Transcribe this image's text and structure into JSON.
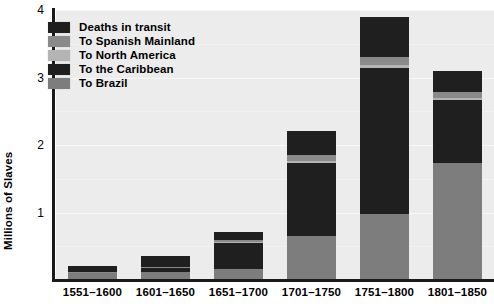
{
  "chart_data": {
    "type": "bar",
    "stacked": true,
    "title": "",
    "xlabel": "",
    "ylabel": "Millions of Slaves",
    "ylim": [
      0,
      4
    ],
    "yticks": [
      "1",
      "2",
      "3",
      "4"
    ],
    "ytick_values": [
      1,
      2,
      3,
      4
    ],
    "grid": true,
    "legend_position": "top-left",
    "categories": [
      "1551–1600",
      "1601–1650",
      "1651–1700",
      "1701–1750",
      "1751–1800",
      "1801–1850"
    ],
    "series": [
      {
        "name": "To Brazil",
        "color": "#7d7d7d",
        "values": [
          0.1,
          0.12,
          0.16,
          0.65,
          0.98,
          1.74
        ]
      },
      {
        "name": "To the Caribbean",
        "color": "#1f1f1f",
        "values": [
          0.0,
          0.06,
          0.39,
          1.09,
          2.16,
          0.92
        ]
      },
      {
        "name": "To North America",
        "color": "#b4b4b4",
        "values": [
          0.0,
          0.0,
          0.01,
          0.02,
          0.04,
          0.03
        ]
      },
      {
        "name": "To Spanish Mainland",
        "color": "#8a8a8a",
        "values": [
          0.02,
          0.02,
          0.03,
          0.09,
          0.13,
          0.1
        ]
      },
      {
        "name": "Deaths in transit",
        "color": "#1f1f1f",
        "values": [
          0.09,
          0.15,
          0.12,
          0.36,
          0.58,
          0.3
        ]
      }
    ],
    "totals": [
      0.21,
      0.35,
      0.71,
      2.21,
      3.89,
      3.09
    ]
  },
  "legend": {
    "items": [
      {
        "label": "Deaths in transit",
        "color": "#1f1f1f"
      },
      {
        "label": "To Spanish Mainland",
        "color": "#8a8a8a"
      },
      {
        "label": "To North America",
        "color": "#b4b4b4"
      },
      {
        "label": "To the Caribbean",
        "color": "#1f1f1f"
      },
      {
        "label": "To Brazil",
        "color": "#7d7d7d"
      }
    ]
  },
  "colors": {
    "plot_background": "#ececec",
    "gridline": "#f8f8f8",
    "axis": "#1a1a1a",
    "page_background": "#ffffff",
    "text": "#000000"
  }
}
